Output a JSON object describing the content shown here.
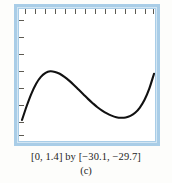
{
  "figure": {
    "caption_range": "[0, 1.4] by [−30.1, −29.7]",
    "caption_label": "(c)",
    "frame_color": "#a9cde7",
    "curve_color": "#111111",
    "background_color": "#fdfdfb",
    "tick_color": "#5d5a52"
  },
  "chart_data": {
    "type": "line",
    "title": "",
    "subtitle": "",
    "xlabel": "",
    "ylabel": "",
    "xlim": [
      0,
      1.4
    ],
    "ylim": [
      -30.1,
      -29.7
    ],
    "grid": false,
    "legend": null,
    "axis_frame": "viewport-rectangle",
    "x_tick_count": 14,
    "y_tick_count": 8,
    "x_tick_step": 0.1,
    "y_tick_step": 0.05,
    "annotations": [],
    "series": [
      {
        "name": "f(x)",
        "x": [
          0.0,
          0.05,
          0.1,
          0.15,
          0.2,
          0.25,
          0.3,
          0.35,
          0.4,
          0.45,
          0.5,
          0.55,
          0.6,
          0.65,
          0.7,
          0.75,
          0.8,
          0.85,
          0.9,
          0.95,
          1.0,
          1.05,
          1.1,
          1.15,
          1.2,
          1.25,
          1.3,
          1.35,
          1.4
        ],
        "y": [
          -30.045,
          -30.0,
          -29.96,
          -29.928,
          -29.906,
          -29.893,
          -29.888,
          -29.89,
          -29.896,
          -29.906,
          -29.918,
          -29.932,
          -29.947,
          -29.962,
          -29.977,
          -29.991,
          -30.004,
          -30.015,
          -30.024,
          -30.031,
          -30.036,
          -30.038,
          -30.037,
          -30.032,
          -30.022,
          -30.005,
          -29.98,
          -29.944,
          -29.896
        ]
      }
    ]
  }
}
